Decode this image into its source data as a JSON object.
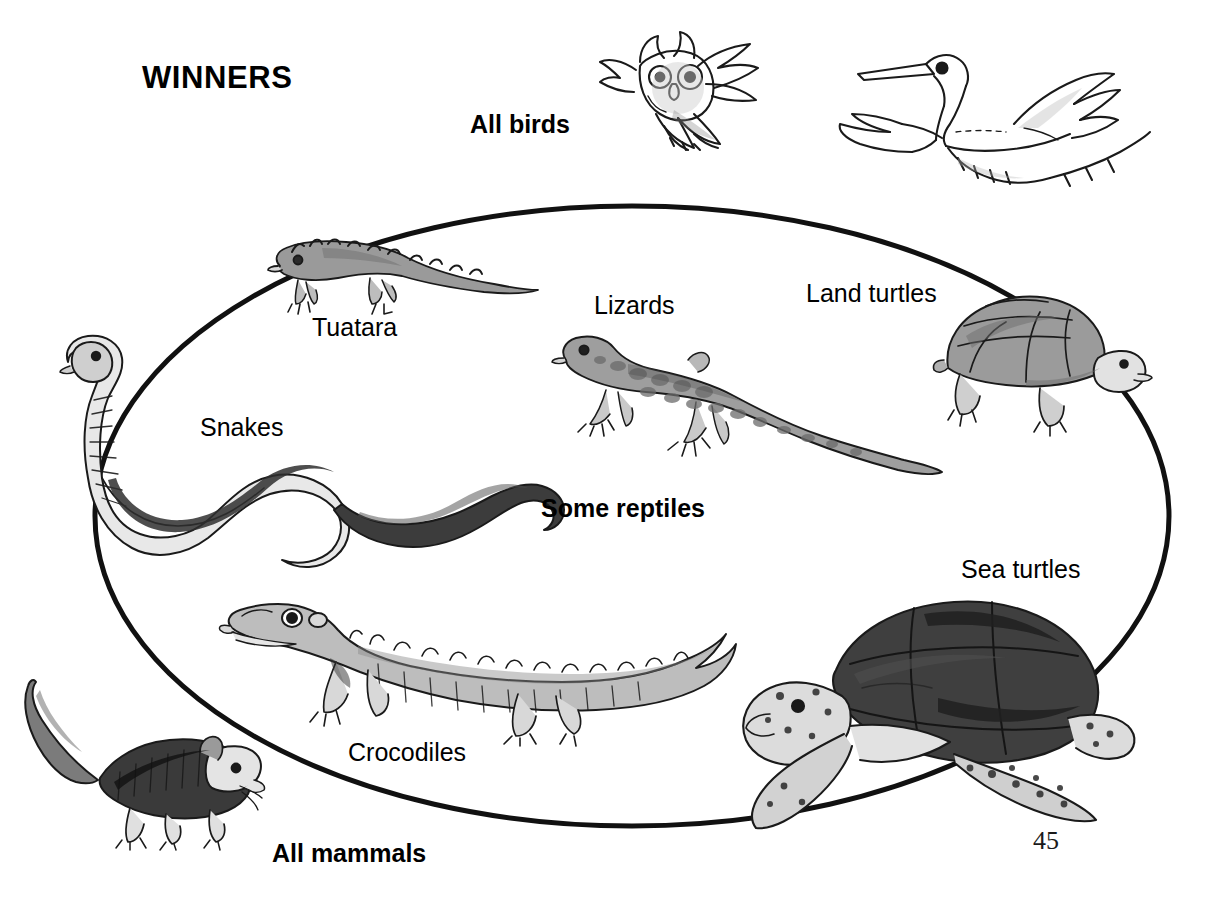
{
  "page": {
    "title": "WINNERS",
    "page_number": "45",
    "background_color": "#ffffff",
    "ink_color": "#000000"
  },
  "groups": {
    "all_birds": "All birds",
    "some_reptiles": "Some reptiles",
    "all_mammals": "All mammals"
  },
  "labels": {
    "tuatara": "Tuatara",
    "snakes": "Snakes",
    "lizards": "Lizards",
    "land_turtles": "Land turtles",
    "sea_turtles": "Sea turtles",
    "crocodiles": "Crocodiles"
  },
  "illustrations": [
    {
      "name": "owl-illustration",
      "group": "All birds",
      "inside_ellipse": false
    },
    {
      "name": "heron-illustration",
      "group": "All birds",
      "inside_ellipse": false
    },
    {
      "name": "shrew-illustration",
      "group": "All mammals",
      "inside_ellipse": false
    },
    {
      "name": "tuatara-illustration",
      "group": "Some reptiles",
      "inside_ellipse": true
    },
    {
      "name": "snake-illustration",
      "group": "Some reptiles",
      "inside_ellipse": true
    },
    {
      "name": "lizard-illustration",
      "group": "Some reptiles",
      "inside_ellipse": true
    },
    {
      "name": "land-turtle-illustration",
      "group": "Some reptiles",
      "inside_ellipse": true
    },
    {
      "name": "crocodile-illustration",
      "group": "Some reptiles",
      "inside_ellipse": true
    },
    {
      "name": "sea-turtle-illustration",
      "group": "Some reptiles",
      "inside_ellipse": true
    }
  ],
  "ellipse": {
    "center_x": 632,
    "center_y": 516,
    "radius_x": 537,
    "radius_y": 310,
    "stroke_color": "#111111",
    "stroke_width": 5,
    "fill": "none"
  }
}
